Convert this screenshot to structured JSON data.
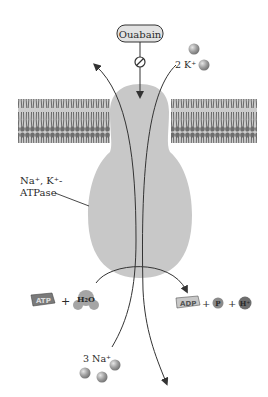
{
  "diagram": {
    "title_label": "Na⁺, K⁺-ATPase pump inhibited by ouabain",
    "inhibitor": {
      "label": "Ouabain",
      "symbol": "inhibit-icon"
    },
    "potassium": {
      "label": "2 K⁺",
      "count": 2
    },
    "sodium": {
      "label": "3 Na⁺",
      "count": 3
    },
    "enzyme": {
      "label_line1": "Na⁺, K⁺-",
      "label_line2": "ATPase"
    },
    "reactants": {
      "atp": "ATP",
      "plus": "+",
      "water": "H₂O"
    },
    "products": {
      "adp": "ADP",
      "plus1": "+",
      "phosphate": "P",
      "plus2": "+",
      "proton": "H⁺"
    },
    "colors": {
      "membrane": "#6e6e6e",
      "enzyme_fill": "#c8c8c8",
      "ion_sphere": "#9a9a9a",
      "arrow": "#333333"
    }
  }
}
